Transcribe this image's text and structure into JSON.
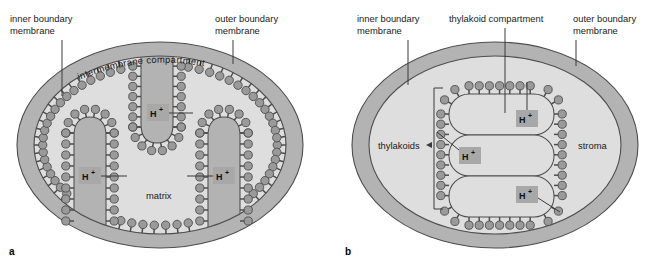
{
  "figure": {
    "background_color": "#ffffff",
    "panels": [
      {
        "id": "a",
        "panel_label": "a",
        "organelle": "mitochondrion",
        "labels": {
          "inner_boundary_membrane": "inner boundary\nmembrane",
          "inner_boundary_membrane_line1": "inner boundary",
          "inner_boundary_membrane_line2": "membrane",
          "outer_boundary_membrane_line1": "outer boundary",
          "outer_boundary_membrane_line2": "membrane",
          "intermembrane_compartment": "intermembrane  compartment",
          "matrix": "matrix"
        },
        "proton_markers": [
          {
            "text": "H",
            "superscript": "+"
          },
          {
            "text": "H",
            "superscript": "+"
          },
          {
            "text": "H",
            "superscript": "+"
          }
        ]
      },
      {
        "id": "b",
        "panel_label": "b",
        "organelle": "chloroplast",
        "labels": {
          "inner_boundary_membrane_line1": "inner boundary",
          "inner_boundary_membrane_line2": "membrane",
          "outer_boundary_membrane_line1": "outer boundary",
          "outer_boundary_membrane_line2": "membrane",
          "thylakoid_compartment": "thylakoid compartment",
          "thylakoids": "thylakoids",
          "stroma": "stroma"
        },
        "proton_markers": [
          {
            "text": "H",
            "superscript": "+"
          },
          {
            "text": "H",
            "superscript": "+"
          },
          {
            "text": "H",
            "superscript": "+"
          }
        ]
      }
    ],
    "colors": {
      "outer_ring_fill": "#b3b3b3",
      "inner_space_fill": "#dededc",
      "particle_fill": "#9a9a9a",
      "proton_box_fill": "#a8a8a8",
      "outline": "#4d4d4d",
      "leader_line": "#3a3a3a",
      "text": "#1a1a1a"
    }
  }
}
